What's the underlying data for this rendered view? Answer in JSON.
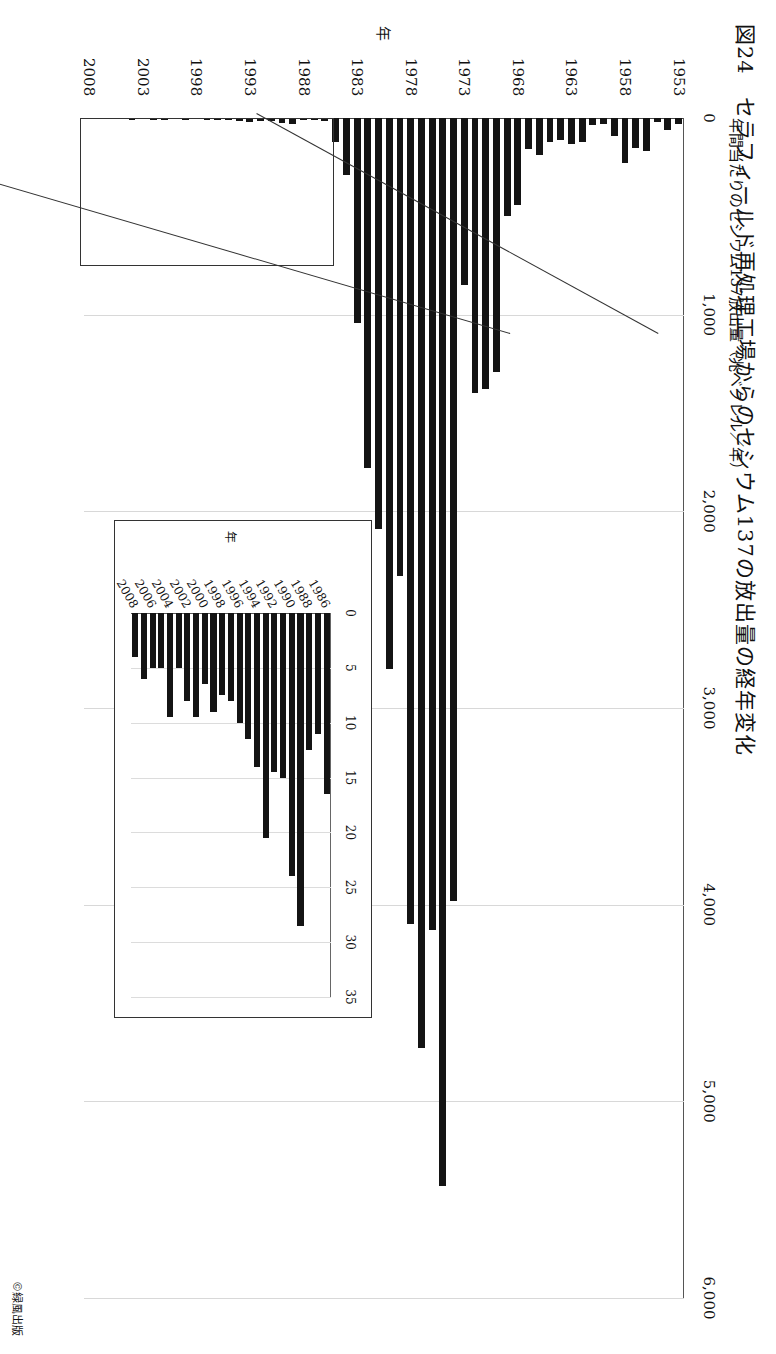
{
  "figure": {
    "title": "図24　セラフィールド再処理工場からのセシウム137の放出量の経年変化",
    "credit": "©緑風出版"
  },
  "chart_data": {
    "type": "bar",
    "title": "図24　セラフィールド再処理工場からのセシウム137の放出量の経年変化",
    "orientation": "horizontal",
    "xlabel": "年",
    "ylabel": "年間当たりのセシウム137放出量（兆ベクレル／年）",
    "ylim": [
      0,
      6000
    ],
    "yticks": [
      "0",
      "1,000",
      "2,000",
      "3,000",
      "4,000",
      "5,000",
      "6,000"
    ],
    "grid": true,
    "legend": "none",
    "categories": [
      "1953",
      "1954",
      "1955",
      "1956",
      "1957",
      "1958",
      "1959",
      "1960",
      "1961",
      "1962",
      "1963",
      "1964",
      "1965",
      "1966",
      "1967",
      "1968",
      "1969",
      "1970",
      "1971",
      "1972",
      "1973",
      "1974",
      "1975",
      "1976",
      "1977",
      "1978",
      "1979",
      "1980",
      "1981",
      "1982",
      "1983",
      "1984",
      "1985",
      "1986",
      "1987",
      "1988",
      "1989",
      "1990",
      "1991",
      "1992",
      "1993",
      "1994",
      "1995",
      "1996",
      "1997",
      "1998",
      "1999",
      "2000",
      "2001",
      "2002",
      "2003",
      "2004",
      "2005",
      "2006",
      "2007",
      "2008"
    ],
    "values": [
      30,
      60,
      20,
      170,
      150,
      230,
      90,
      30,
      35,
      120,
      130,
      110,
      120,
      190,
      160,
      440,
      500,
      1290,
      1380,
      1400,
      850,
      3980,
      5430,
      4130,
      4730,
      4100,
      2330,
      2800,
      2090,
      1780,
      1040,
      290,
      120,
      16,
      11,
      12,
      28,
      24,
      15,
      14,
      20,
      13,
      11,
      10,
      8,
      7,
      9,
      6,
      10,
      8,
      5,
      10,
      5,
      5,
      6,
      4
    ],
    "tick_label_years": [
      "1953",
      "1958",
      "1963",
      "1968",
      "1973",
      "1978",
      "1983",
      "1988",
      "1993",
      "1998",
      "2003",
      "2008"
    ],
    "inset": {
      "type": "bar",
      "orientation": "horizontal",
      "xlabel": "年",
      "ylim": [
        0,
        35
      ],
      "yticks": [
        "0",
        "5",
        "10",
        "15",
        "20",
        "25",
        "30",
        "35"
      ],
      "grid": true,
      "categories": [
        "1986",
        "1987",
        "1988",
        "1989",
        "1990",
        "1991",
        "1992",
        "1993",
        "1994",
        "1995",
        "1996",
        "1997",
        "1998",
        "1999",
        "2000",
        "2001",
        "2002",
        "2003",
        "2004",
        "2005",
        "2006",
        "2007",
        "2008"
      ],
      "values": [
        16.5,
        11.0,
        12.5,
        28.5,
        24.0,
        15.0,
        14.5,
        20.5,
        14.0,
        11.5,
        10.0,
        8.0,
        7.5,
        9.0,
        6.5,
        9.5,
        8.0,
        5.0,
        9.5,
        5.0,
        5.0,
        6.0,
        4.0
      ],
      "tick_label_years": [
        "1986",
        "1988",
        "1990",
        "1992",
        "1994",
        "1996",
        "1998",
        "2000",
        "2002",
        "2004",
        "2006",
        "2008"
      ]
    }
  }
}
